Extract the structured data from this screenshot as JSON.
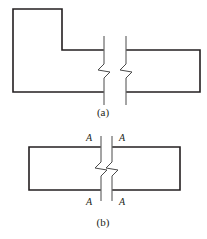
{
  "figure": {
    "type": "engineering-drawing",
    "background_color": "#ffffff",
    "line_color": "#231f20",
    "break_line_color": "#4a4a4a",
    "panels": [
      {
        "id": "a",
        "caption": "(a)",
        "caption_position": {
          "x": 103,
          "y": 116
        },
        "shape": "stepped-L-profile-with-break",
        "left_part": {
          "name": "stepped-L-body",
          "vertices": [
            {
              "x": 13,
              "y": 9
            },
            {
              "x": 62,
              "y": 9
            },
            {
              "x": 62,
              "y": 50
            },
            {
              "x": 103,
              "y": 50
            },
            {
              "x": 103,
              "y": 92
            },
            {
              "x": 13,
              "y": 92
            }
          ]
        },
        "right_part": {
          "name": "rectangular-body",
          "vertices": [
            {
              "x": 127,
              "y": 50
            },
            {
              "x": 200,
              "y": 50
            },
            {
              "x": 200,
              "y": 92
            },
            {
              "x": 127,
              "y": 92
            }
          ]
        },
        "break_lines": [
          {
            "name": "break-line-left",
            "x": 104,
            "top_y": 36,
            "bottom_y": 105,
            "jog_y": 68,
            "jog_direction": "left"
          },
          {
            "name": "break-line-right",
            "x": 126,
            "top_y": 36,
            "bottom_y": 105,
            "jog_y": 68,
            "jog_direction": "left"
          }
        ]
      },
      {
        "id": "b",
        "caption": "(b)",
        "caption_position": {
          "x": 103,
          "y": 225
        },
        "shape": "rectangular-member-with-section-cut",
        "left_part": {
          "name": "left-rectangle",
          "vertices": [
            {
              "x": 29,
              "y": 147
            },
            {
              "x": 100,
              "y": 147
            },
            {
              "x": 100,
              "y": 190
            },
            {
              "x": 29,
              "y": 190
            }
          ]
        },
        "right_part": {
          "name": "right-rectangle",
          "vertices": [
            {
              "x": 113,
              "y": 147
            },
            {
              "x": 180,
              "y": 147
            },
            {
              "x": 180,
              "y": 190
            },
            {
              "x": 113,
              "y": 190
            }
          ]
        },
        "break_lines": [
          {
            "name": "break-line-left",
            "x": 101,
            "top_y": 136,
            "bottom_y": 201,
            "jog_y": 166,
            "jog_direction": "left"
          },
          {
            "name": "break-line-right",
            "x": 112,
            "top_y": 136,
            "bottom_y": 201,
            "jog_y": 166,
            "jog_direction": "left"
          }
        ],
        "section_labels": [
          {
            "text": "A",
            "name": "section-label-top-left",
            "x": 89,
            "y": 141
          },
          {
            "text": "A",
            "name": "section-label-top-right",
            "x": 119,
            "y": 141
          },
          {
            "text": "A",
            "name": "section-label-bottom-left",
            "x": 89,
            "y": 203
          },
          {
            "text": "A",
            "name": "section-label-bottom-right",
            "x": 119,
            "y": 203
          }
        ]
      }
    ]
  },
  "labels": {
    "caption_a": "(a)",
    "caption_b": "(b)",
    "section_a": "A"
  }
}
